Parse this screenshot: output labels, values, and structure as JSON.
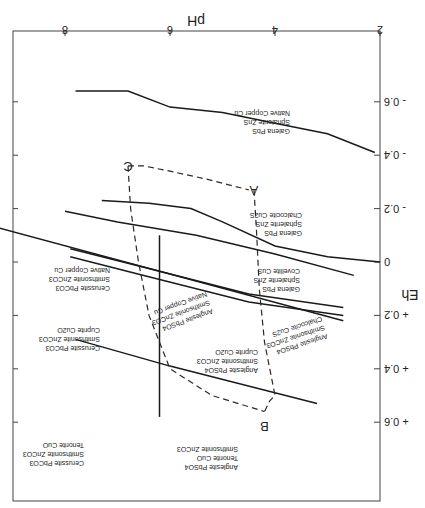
{
  "chart_data": {
    "type": "line",
    "orientation": "rotated-180",
    "title": "",
    "xlabel": "pH",
    "ylabel": "Eh",
    "xlim": [
      2,
      9
    ],
    "ylim": [
      -0.8,
      0.8
    ],
    "x_ticks": [
      {
        "value": 2,
        "label": "2"
      },
      {
        "value": 4,
        "label": "4"
      },
      {
        "value": 6,
        "label": "6"
      },
      {
        "value": 8,
        "label": "8"
      }
    ],
    "y_ticks": [
      {
        "value": -0.6,
        "label": "- 0.6"
      },
      {
        "value": -0.4,
        "label": "- 0.4"
      },
      {
        "value": -0.2,
        "label": "- 0.2"
      },
      {
        "value": 0,
        "label": "0"
      },
      {
        "value": 0.2,
        "label": "+ 0.2"
      },
      {
        "value": 0.4,
        "label": "+ 0.4"
      },
      {
        "value": 0.6,
        "label": "+ 0.6"
      }
    ],
    "boundaries": [
      {
        "name": "native-copper-boundary",
        "points": [
          [
            2.1,
            -0.41
          ],
          [
            3.0,
            -0.48
          ],
          [
            4.0,
            -0.52
          ],
          [
            5.0,
            -0.56
          ],
          [
            6.0,
            -0.58
          ],
          [
            6.8,
            -0.64
          ],
          [
            7.8,
            -0.64
          ]
        ]
      },
      {
        "name": "chalcocite-covellite-boundary",
        "points": [
          [
            2.0,
            0.0
          ],
          [
            3.0,
            -0.02
          ],
          [
            4.0,
            -0.06
          ],
          [
            5.0,
            -0.15
          ],
          [
            5.6,
            -0.2
          ],
          [
            6.4,
            -0.22
          ],
          [
            7.3,
            -0.23
          ]
        ]
      },
      {
        "name": "covellite-galena-boundary",
        "points": [
          [
            2.5,
            0.05
          ],
          [
            4.0,
            -0.03
          ],
          [
            5.5,
            -0.1
          ],
          [
            7.0,
            -0.15
          ],
          [
            8.0,
            -0.19
          ]
        ]
      },
      {
        "name": "pbs-anglesite-lower-boundary",
        "points": [
          [
            2.7,
            0.22
          ],
          [
            9.5,
            -0.14
          ]
        ]
      },
      {
        "name": "anglesite-band-upper",
        "points": [
          [
            2.7,
            0.17
          ],
          [
            4.5,
            0.12
          ],
          [
            6.5,
            0.02
          ],
          [
            7.9,
            -0.05
          ]
        ]
      },
      {
        "name": "anglesite-band-lower",
        "points": [
          [
            2.7,
            0.2
          ],
          [
            4.5,
            0.15
          ],
          [
            6.5,
            0.05
          ],
          [
            7.9,
            -0.02
          ]
        ]
      },
      {
        "name": "cuprite-tenorite-boundary",
        "points": [
          [
            3.2,
            0.53
          ],
          [
            6.0,
            0.39
          ],
          [
            7.8,
            0.29
          ]
        ]
      },
      {
        "name": "cerussite-anglesite-vertical",
        "points": [
          [
            6.2,
            -0.1
          ],
          [
            6.2,
            0.58
          ]
        ]
      }
    ],
    "paths": [
      {
        "name": "path-a-b",
        "points": [
          [
            4.4,
            -0.27
          ],
          [
            4.35,
            -0.11
          ],
          [
            4.3,
            0.1
          ],
          [
            4.2,
            0.3
          ],
          [
            4.0,
            0.5
          ],
          [
            4.1,
            0.52
          ],
          [
            4.2,
            0.56
          ]
        ]
      },
      {
        "name": "path-c-b",
        "points": [
          [
            6.8,
            -0.36
          ],
          [
            6.5,
            -0.36
          ],
          [
            6.0,
            -0.34
          ],
          [
            5.3,
            -0.31
          ],
          [
            4.5,
            -0.27
          ]
        ]
      },
      {
        "name": "path-c-down",
        "points": [
          [
            6.8,
            -0.36
          ],
          [
            6.75,
            -0.2
          ],
          [
            6.6,
            0.0
          ],
          [
            6.4,
            0.2
          ],
          [
            6.0,
            0.4
          ],
          [
            5.2,
            0.5
          ],
          [
            4.2,
            0.56
          ]
        ]
      }
    ],
    "points": [
      {
        "label": "A",
        "pH": 4.4,
        "Eh": -0.27
      },
      {
        "label": "B",
        "pH": 4.2,
        "Eh": 0.56
      },
      {
        "label": "C",
        "pH": 6.8,
        "Eh": -0.36
      }
    ],
    "fields": [
      {
        "name": "field-native-copper",
        "lines": [
          "Galena  PbS",
          "Sphalerite ZnS",
          "Native Copper Cu"
        ]
      },
      {
        "name": "field-chalcocite",
        "lines": [
          "Galena  PbS",
          "Sphalerite ZnS",
          "Chalcocite Cu2S"
        ]
      },
      {
        "name": "field-covellite",
        "lines": [
          "Galena PbS",
          "Sphalerite ZnS",
          "Covellite CuS"
        ]
      },
      {
        "name": "field-anglesite-chalcocite",
        "lines": [
          "Anglesite PbSO4",
          "Smithsonite ZnCO3",
          "Chalcocite Cu2S"
        ]
      },
      {
        "name": "field-anglesite-native-copper",
        "lines": [
          "Anglesite PbSO4",
          "Smithsonite ZnCO3",
          "Native Copper Cu"
        ]
      },
      {
        "name": "field-anglesite-cuprite",
        "lines": [
          "Anglesite PbSO4",
          "Smithsonite ZnCO3",
          "Cuprite Cu2O"
        ]
      },
      {
        "name": "field-cerussite-native-copper",
        "lines": [
          "Cerussite PbCO3",
          "Smithsonite ZnCO3",
          "Native Copper Cu"
        ]
      },
      {
        "name": "field-cerussite-cuprite",
        "lines": [
          "Cerussite PbCO3",
          "Smithsonite ZnCO3",
          "Cuprite Cu2O"
        ]
      },
      {
        "name": "field-anglesite-tenorite",
        "lines": [
          "Anglesite PbSO4",
          "Tenorite CuO",
          "Smithsonite ZnCO3"
        ]
      },
      {
        "name": "field-cerussite-tenorite",
        "lines": [
          "Cerussite PbCO3",
          "Smithsonite ZnCO3",
          "Tenorite CuO"
        ]
      }
    ]
  }
}
